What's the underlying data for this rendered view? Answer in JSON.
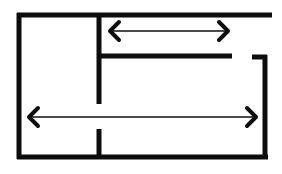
{
  "diagram": {
    "type": "architectural-floor-plan",
    "canvas": {
      "width": 282,
      "height": 174,
      "background": "#ffffff"
    },
    "colors": {
      "wall": "#0d0d0d",
      "dimension_line": "#4a4a4a",
      "dimension_head": "#0d0d0d",
      "background": "#ffffff"
    },
    "stroke_widths": {
      "outer_wall": 5,
      "interior_wall": 5,
      "dimension_line": 2,
      "dimension_head": 4
    },
    "walls": [
      {
        "id": "wall-top",
        "label": "Top exterior wall",
        "orientation": "horizontal",
        "x1": 17,
        "y1": 15,
        "x2": 272,
        "y2": 15
      },
      {
        "id": "wall-left",
        "label": "Left exterior wall",
        "orientation": "vertical",
        "x1": 19,
        "y1": 13,
        "x2": 19,
        "y2": 159
      },
      {
        "id": "wall-bottom",
        "label": "Bottom exterior wall",
        "orientation": "horizontal",
        "x1": 17,
        "y1": 157,
        "x2": 268,
        "y2": 157
      },
      {
        "id": "wall-right",
        "label": "Right exterior wall lower segment",
        "orientation": "vertical",
        "x1": 265,
        "y1": 56,
        "x2": 265,
        "y2": 159
      },
      {
        "id": "wall-right-stub",
        "label": "Right wall return stub",
        "orientation": "horizontal",
        "x1": 253,
        "y1": 57,
        "x2": 267,
        "y2": 57
      },
      {
        "id": "wall-partition-upper",
        "label": "Vertical partition upper segment",
        "orientation": "vertical",
        "x1": 99,
        "y1": 15,
        "x2": 99,
        "y2": 104
      },
      {
        "id": "wall-partition-lower",
        "label": "Vertical partition lower segment",
        "orientation": "vertical",
        "x1": 99,
        "y1": 129,
        "x2": 99,
        "y2": 157
      },
      {
        "id": "wall-interior-horizontal",
        "label": "Interior horizontal partition",
        "orientation": "horizontal",
        "x1": 99,
        "y1": 56,
        "x2": 232,
        "y2": 56
      }
    ],
    "openings": [
      {
        "id": "opening-partition",
        "label": "Doorway gap in vertical partition",
        "x": 99,
        "y_start": 104,
        "y_end": 129
      },
      {
        "id": "opening-top-right",
        "label": "Gap between top wall end and right wall",
        "x_start": 272,
        "x_end": 265,
        "y": 15
      }
    ],
    "dimensions": [
      {
        "id": "dimension-upper",
        "label": "Upper room width dimension",
        "text": "",
        "y": 31,
        "x_start": 110,
        "x_end": 228,
        "arrowheads": "both",
        "style": "double-headed-chevron"
      },
      {
        "id": "dimension-lower",
        "label": "Overall width dimension",
        "text": "",
        "y": 117,
        "x_start": 29,
        "x_end": 256,
        "arrowheads": "both",
        "style": "double-headed-chevron"
      }
    ]
  }
}
